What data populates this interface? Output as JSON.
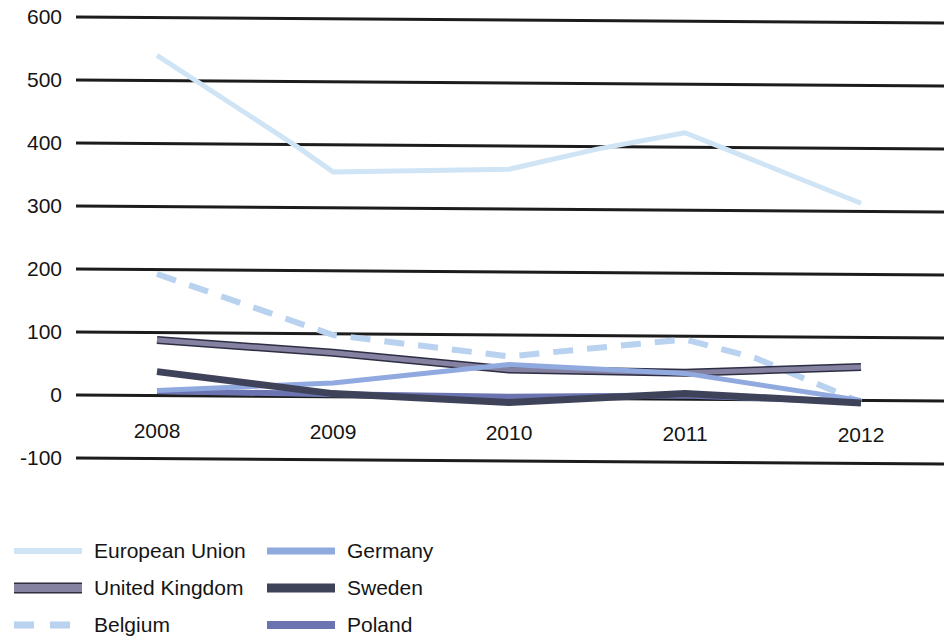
{
  "chart_data": {
    "type": "line",
    "title": "",
    "subtitle": "",
    "xlabel": "",
    "ylabel": "",
    "categories": [
      "2008",
      "2009",
      "2010",
      "2011",
      "2012"
    ],
    "x": [
      2008,
      2009,
      2010,
      2011,
      2012
    ],
    "ylim": [
      -100,
      600
    ],
    "xlim": [
      2008,
      2012
    ],
    "yticks": [
      "600",
      "500",
      "400",
      "300",
      "200",
      "100",
      "0",
      "-100"
    ],
    "ytick_values": [
      600,
      500,
      400,
      300,
      200,
      100,
      0,
      -100
    ],
    "xticks": [
      "2008",
      "2009",
      "2010",
      "2011",
      "2012"
    ],
    "grid": true,
    "grid_color": "#1c1c1c",
    "legend_position": "bottom-left",
    "series": [
      {
        "name": "European Union",
        "color": "#cfe4f5",
        "style": "solid",
        "width": 5,
        "values": [
          540,
          396,
          363,
          396,
          313
        ],
        "points": [
          {
            "x": 2008.0,
            "y": 540
          },
          {
            "x": 2008.8,
            "y": 396
          },
          {
            "x": 2009.0,
            "y": 357
          },
          {
            "x": 2010.0,
            "y": 363
          },
          {
            "x": 2010.5,
            "y": 396
          },
          {
            "x": 2011.0,
            "y": 423
          },
          {
            "x": 2011.3,
            "y": 390
          },
          {
            "x": 2012.0,
            "y": 313
          }
        ]
      },
      {
        "name": "Germany",
        "color": "#90a9de",
        "style": "solid",
        "width": 5,
        "values": [
          8,
          22,
          53,
          41,
          0
        ],
        "points": [
          {
            "x": 2008.0,
            "y": 8
          },
          {
            "x": 2009.0,
            "y": 22
          },
          {
            "x": 2010.0,
            "y": 53
          },
          {
            "x": 2011.0,
            "y": 41
          },
          {
            "x": 2012.0,
            "y": 0
          }
        ]
      },
      {
        "name": "United Kingdom",
        "color": "#8482a0",
        "outline": "#2d2d44",
        "style": "solid",
        "width": 5,
        "values": [
          88,
          70,
          45,
          42,
          53
        ],
        "points": [
          {
            "x": 2008.0,
            "y": 88
          },
          {
            "x": 2009.0,
            "y": 70
          },
          {
            "x": 2010.0,
            "y": 45
          },
          {
            "x": 2011.0,
            "y": 42
          },
          {
            "x": 2012.0,
            "y": 53
          }
        ]
      },
      {
        "name": "Sweden",
        "color": "#3e4359",
        "style": "solid",
        "width": 7,
        "values": [
          38,
          5,
          -7,
          9,
          -4
        ],
        "points": [
          {
            "x": 2008.0,
            "y": 38
          },
          {
            "x": 2009.0,
            "y": 5
          },
          {
            "x": 2010.0,
            "y": -7
          },
          {
            "x": 2011.0,
            "y": 9
          },
          {
            "x": 2012.0,
            "y": -4
          }
        ]
      },
      {
        "name": "Belgium",
        "color": "#b9d2f0",
        "style": "dashed",
        "width": 6,
        "values": [
          193,
          98,
          66,
          95,
          -3
        ],
        "points": [
          {
            "x": 2008.0,
            "y": 193
          },
          {
            "x": 2009.0,
            "y": 98
          },
          {
            "x": 2010.0,
            "y": 66
          },
          {
            "x": 2011.0,
            "y": 95
          },
          {
            "x": 2011.4,
            "y": 66
          },
          {
            "x": 2012.0,
            "y": -3
          }
        ]
      },
      {
        "name": "Poland",
        "color": "#6b74b0",
        "style": "solid",
        "width": 6,
        "values": [
          7,
          4,
          2,
          6,
          -2
        ],
        "points": [
          {
            "x": 2008.0,
            "y": 7
          },
          {
            "x": 2009.0,
            "y": 4
          },
          {
            "x": 2010.0,
            "y": 2
          },
          {
            "x": 2011.0,
            "y": 6
          },
          {
            "x": 2012.0,
            "y": -2
          }
        ]
      }
    ]
  },
  "legend": {
    "items": [
      {
        "label": "European Union",
        "color": "#cfe4f5",
        "style": "solid",
        "width": 6
      },
      {
        "label": "Germany",
        "color": "#90a9de",
        "style": "solid",
        "width": 7
      },
      {
        "label": "United Kingdom",
        "color": "#8482a0",
        "style": "outline",
        "width": 8
      },
      {
        "label": "Sweden",
        "color": "#3e4359",
        "style": "solid",
        "width": 9
      },
      {
        "label": "Belgium",
        "color": "#b9d2f0",
        "style": "dashed",
        "width": 7
      },
      {
        "label": "Poland",
        "color": "#6b74b0",
        "style": "solid",
        "width": 8
      }
    ]
  }
}
